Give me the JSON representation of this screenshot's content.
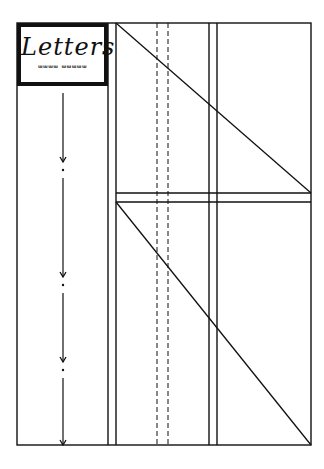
{
  "title_box": {
    "title": "Letters",
    "subtitle": "ᵚᵚᵚᵚ ᵚᵚᵚᵚᵚ"
  },
  "diagram": {
    "frame": {
      "left": 17,
      "top": 23,
      "right": 311,
      "bottom": 445
    },
    "stroke_color": "#111111",
    "vertical_lines": [
      {
        "x": 108,
        "style": "solid"
      },
      {
        "x": 116,
        "style": "solid"
      },
      {
        "x": 157,
        "style": "dashed"
      },
      {
        "x": 168,
        "style": "dashed"
      },
      {
        "x": 209,
        "style": "solid"
      },
      {
        "x": 217,
        "style": "solid"
      }
    ],
    "horizontal_lines": [
      {
        "y": 193,
        "x1": 116,
        "x2": 311
      },
      {
        "y": 202,
        "x1": 116,
        "x2": 311
      }
    ],
    "diagonals": [
      {
        "x1": 116,
        "y1": 23,
        "x2": 311,
        "y2": 193
      },
      {
        "x1": 116,
        "y1": 202,
        "x2": 311,
        "y2": 445
      }
    ],
    "arrow_column": {
      "x": 63,
      "segments": [
        {
          "y1": 93,
          "y2": 162
        },
        {
          "y1": 178,
          "y2": 277
        },
        {
          "y1": 293,
          "y2": 362
        },
        {
          "y1": 378,
          "y2": 445
        }
      ],
      "dots": [
        170,
        285,
        370
      ]
    }
  }
}
